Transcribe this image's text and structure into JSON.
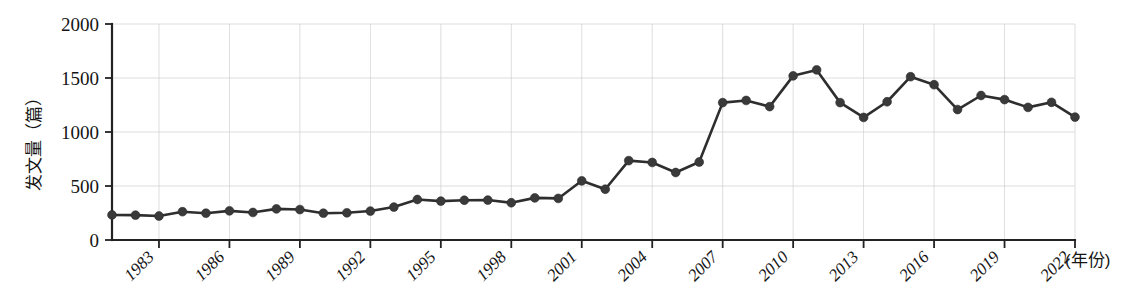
{
  "chart_data": {
    "type": "line",
    "title": "",
    "subtitle": "",
    "xlabel": "(年份)",
    "ylabel": "发文量（篇）",
    "xlim": [
      1981,
      2022
    ],
    "ylim": [
      0,
      2000
    ],
    "grid": true,
    "legend": "none",
    "marker": "filled-circle",
    "line_color": "#2e2e2e",
    "marker_color": "#3a3a3a",
    "y_ticks": [
      "0",
      "500",
      "1000",
      "1500",
      "2000"
    ],
    "y_tick_values": [
      0,
      500,
      1000,
      1500,
      2000
    ],
    "x_ticks": [
      "1983",
      "1986",
      "1989",
      "1992",
      "1995",
      "1998",
      "2001",
      "2004",
      "2007",
      "2010",
      "2013",
      "2016",
      "2019",
      "2022"
    ],
    "x_tick_values": [
      1983,
      1986,
      1989,
      1992,
      1995,
      1998,
      2001,
      2004,
      2007,
      2010,
      2013,
      2016,
      2019,
      2022
    ],
    "x": [
      1981,
      1982,
      1983,
      1984,
      1985,
      1986,
      1987,
      1988,
      1989,
      1990,
      1991,
      1992,
      1993,
      1994,
      1995,
      1996,
      1997,
      1998,
      1999,
      2000,
      2001,
      2002,
      2003,
      2004,
      2005,
      2006,
      2007,
      2008,
      2009,
      2010,
      2011,
      2012,
      2013,
      2014,
      2015,
      2016,
      2017,
      2018,
      2019,
      2020,
      2021,
      2022
    ],
    "values": [
      232,
      230,
      222,
      262,
      248,
      270,
      255,
      288,
      282,
      248,
      252,
      268,
      305,
      375,
      360,
      368,
      370,
      345,
      390,
      385,
      548,
      470,
      735,
      718,
      625,
      722,
      1272,
      1292,
      1235,
      1520,
      1575,
      1272,
      1135,
      1280,
      1512,
      1438,
      1208,
      1338,
      1300,
      1228,
      1275,
      1138
    ],
    "series_name": "发文量"
  },
  "axis": {
    "y_label_text": "发文量（篇）",
    "x_label_text": "(年份)"
  }
}
